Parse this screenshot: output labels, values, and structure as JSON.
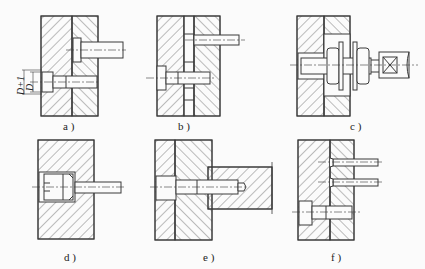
{
  "figure": {
    "panels": [
      {
        "id": "a",
        "label": "a )",
        "description": "two-plate assembly, screw in counterbored hole with clearance D+1 over D, ejector/guide pin above"
      },
      {
        "id": "b",
        "label": "b )",
        "description": "two plates with spacer gap, pin on top, cap screw below"
      },
      {
        "id": "c",
        "label": "c )",
        "description": "stud with washers and nuts clamping through plate, square-end rod"
      },
      {
        "id": "d",
        "label": "d )",
        "description": "single block with slotted threaded plug holding pin"
      },
      {
        "id": "e",
        "label": "e )",
        "description": "two plates with cap screw threaded into projecting block"
      },
      {
        "id": "f",
        "label": "f )",
        "description": "two plates with two pins above and cap screw below"
      }
    ],
    "dimensions": {
      "outer": "D+1",
      "inner": "D"
    }
  },
  "colors": {
    "line": "#3a3a3a",
    "hatch": "#5a5a5a",
    "background": "#fbfbfb"
  }
}
